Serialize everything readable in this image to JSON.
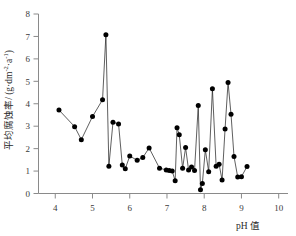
{
  "chart_data": {
    "type": "scatter",
    "title": "",
    "subtitle": "",
    "xlabel": "pH 值",
    "ylabel": "平均腐蚀率/ (g·dm⁻²·a⁻¹)",
    "ylabel_parts": {
      "name": "平均腐蚀率",
      "separator": "/ (g·dm",
      "exp1": "-2",
      "mid": "·a",
      "exp2": "-1",
      "close": ")"
    },
    "xlim": [
      3.55,
      10.25
    ],
    "ylim": [
      0,
      8
    ],
    "xticks": [
      4,
      5,
      6,
      7,
      8,
      9,
      10
    ],
    "yticks": [
      0,
      1,
      2,
      3,
      4,
      5,
      6,
      7,
      8
    ],
    "xticklabels": [
      "4",
      "5",
      "6",
      "7",
      "8",
      "9",
      "10"
    ],
    "yticklabels": [
      "0",
      "1",
      "2",
      "3",
      "4",
      "5",
      "6",
      "7",
      "8"
    ],
    "grid": false,
    "legend": false,
    "legend_position": "none",
    "marker": "filled-circle",
    "marker_color": "#000000",
    "line_color": "#1a1a1a",
    "connected": true,
    "x": [
      4.1,
      4.52,
      4.7,
      5.0,
      5.27,
      5.36,
      5.44,
      5.55,
      5.7,
      5.8,
      5.88,
      6.0,
      6.2,
      6.35,
      6.52,
      6.8,
      6.98,
      7.06,
      7.14,
      7.22,
      7.27,
      7.33,
      7.42,
      7.5,
      7.58,
      7.66,
      7.74,
      7.84,
      7.9,
      7.95,
      8.03,
      8.12,
      8.22,
      8.32,
      8.4,
      8.48,
      8.56,
      8.64,
      8.72,
      8.8,
      8.9,
      9.0,
      9.15
    ],
    "y": [
      3.72,
      2.98,
      2.4,
      3.43,
      4.18,
      7.08,
      1.22,
      3.17,
      3.1,
      1.27,
      1.1,
      1.67,
      1.48,
      1.6,
      2.03,
      1.13,
      1.05,
      1.02,
      1.0,
      0.57,
      2.93,
      2.62,
      1.12,
      2.05,
      1.05,
      1.18,
      1.02,
      3.92,
      0.17,
      0.45,
      1.95,
      0.97,
      4.67,
      1.22,
      1.3,
      0.6,
      2.88,
      4.95,
      3.53,
      1.65,
      0.73,
      0.75,
      1.2
    ],
    "values_label": "平均腐蚀率",
    "categories_label": "pH 值"
  },
  "axes": {
    "x_title": "pH 值",
    "y_title": "平均腐蚀率/ (g·dm⁻²·a⁻¹)"
  }
}
